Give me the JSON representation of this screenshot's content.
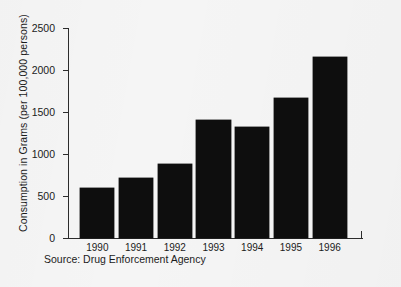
{
  "figure": {
    "background_color": "#f5f5f5",
    "bar_color": "#0e0e0e",
    "axis_color": "#2c2c2c",
    "source_note": "Source: Drug Enforcement Agency"
  },
  "chart_data": {
    "type": "bar",
    "title": "",
    "subtitle": "",
    "xlabel": "",
    "ylabel": "Consumption in Grams (per 100,000 persons)",
    "categories": [
      "1990",
      "1991",
      "1992",
      "1993",
      "1994",
      "1995",
      "1996"
    ],
    "values": [
      595,
      715,
      880,
      1400,
      1320,
      1670,
      2150
    ],
    "series": [
      {
        "name": "Consumption",
        "values": [
          595,
          715,
          880,
          1400,
          1320,
          1670,
          2150
        ]
      }
    ],
    "ylim": [
      0,
      2500
    ],
    "yticks": [
      0,
      500,
      1000,
      1500,
      2000,
      2500
    ],
    "ytick_labels": [
      "0",
      "500",
      "1000",
      "1500",
      "2000",
      "2500"
    ],
    "xtick_labels": [
      "1990",
      "1991",
      "1992",
      "1993",
      "1994",
      "1995",
      "1996"
    ],
    "grid": false,
    "legend": false,
    "legend_position": "none",
    "annotations": [
      "Source: Drug Enforcement Agency"
    ]
  }
}
